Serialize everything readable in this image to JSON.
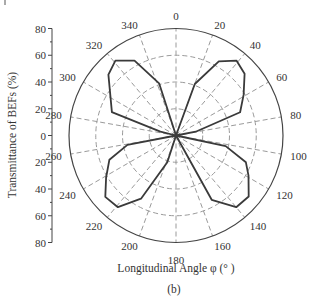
{
  "chart_data": {
    "type": "polar-line",
    "title": "",
    "subtitle": "(b)",
    "xlabel": "Longitudinal Angle φ (° )",
    "ylabel": "Transmittance of BEFs (%)",
    "radial_axis": {
      "range": [
        0,
        80
      ],
      "ticks": [
        0,
        20,
        40,
        60,
        80
      ],
      "tick_labels_up": [
        "80",
        "60",
        "40",
        "20",
        "0"
      ],
      "tick_labels_down": [
        "20",
        "40",
        "60",
        "80"
      ],
      "grid": true,
      "grid_style": "dashed"
    },
    "angular_axis": {
      "direction": "clockwise",
      "zero_at": "top",
      "ticks": [
        0,
        20,
        40,
        60,
        80,
        100,
        120,
        140,
        160,
        180,
        200,
        220,
        240,
        260,
        280,
        300,
        320,
        340
      ],
      "tick_labels": [
        "0",
        "20",
        "40",
        "60",
        "80",
        "100",
        "120",
        "140",
        "160",
        "180",
        "200",
        "220",
        "240",
        "260",
        "280",
        "300",
        "320",
        "340"
      ],
      "grid": true,
      "grid_style": "dashed"
    },
    "series": [
      {
        "name": "Transmittance",
        "color": "#3a3a3a",
        "points": [
          {
            "angle": 0,
            "r": 0
          },
          {
            "angle": 20,
            "r": 41
          },
          {
            "angle": 30,
            "r": 64
          },
          {
            "angle": 39,
            "r": 72
          },
          {
            "angle": 48,
            "r": 69
          },
          {
            "angle": 59,
            "r": 59
          },
          {
            "angle": 70,
            "r": 51
          },
          {
            "angle": 79,
            "r": 15
          },
          {
            "angle": 90,
            "r": 0
          },
          {
            "angle": 102,
            "r": 38
          },
          {
            "angle": 111,
            "r": 56
          },
          {
            "angle": 119,
            "r": 62
          },
          {
            "angle": 130,
            "r": 71
          },
          {
            "angle": 140,
            "r": 70
          },
          {
            "angle": 151,
            "r": 55
          },
          {
            "angle": 180,
            "r": 0
          },
          {
            "angle": 198,
            "r": 21
          },
          {
            "angle": 209,
            "r": 54
          },
          {
            "angle": 219,
            "r": 69
          },
          {
            "angle": 229,
            "r": 70
          },
          {
            "angle": 239,
            "r": 61
          },
          {
            "angle": 250,
            "r": 53
          },
          {
            "angle": 259,
            "r": 37
          },
          {
            "angle": 270,
            "r": 0
          },
          {
            "angle": 284,
            "r": 12
          },
          {
            "angle": 290,
            "r": 51
          },
          {
            "angle": 312,
            "r": 68
          },
          {
            "angle": 321,
            "r": 72
          },
          {
            "angle": 331,
            "r": 64
          },
          {
            "angle": 342,
            "r": 41
          },
          {
            "angle": 360,
            "r": 0
          }
        ]
      }
    ]
  },
  "labels": {
    "xlabel": "Longitudinal Angle φ (° )",
    "ylabel": "Transmittance of BEFs (%)",
    "caption": "(b)"
  }
}
